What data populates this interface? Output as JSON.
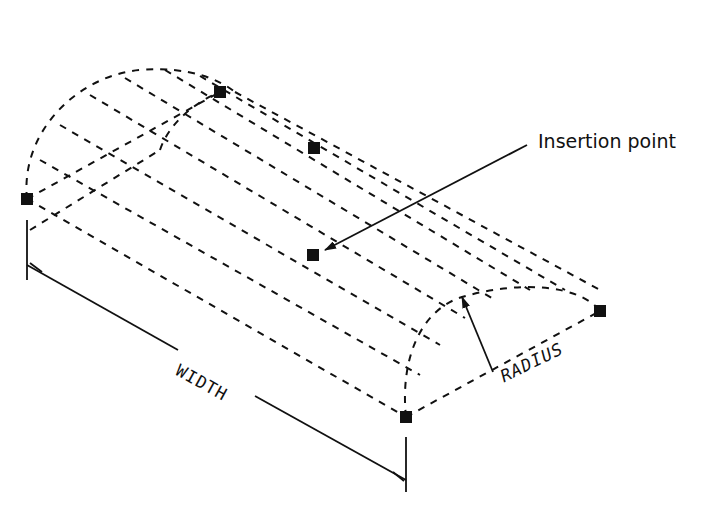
{
  "diagram": {
    "type": "cad-isometric-half-cylinder",
    "labels": {
      "insertion_point": "Insertion point",
      "width": "WIDTH",
      "radius": "RADIUS"
    },
    "grips": [
      {
        "name": "left-base-grip",
        "x": 27,
        "y": 199
      },
      {
        "name": "top-left-arc-grip",
        "x": 220,
        "y": 92
      },
      {
        "name": "top-center-grip",
        "x": 314,
        "y": 148
      },
      {
        "name": "insertion-point-grip",
        "x": 313,
        "y": 255
      },
      {
        "name": "right-base-grip",
        "x": 600,
        "y": 311
      },
      {
        "name": "front-base-grip",
        "x": 406,
        "y": 417
      }
    ],
    "colors": {
      "stroke": "#111111",
      "background": "#ffffff"
    }
  }
}
